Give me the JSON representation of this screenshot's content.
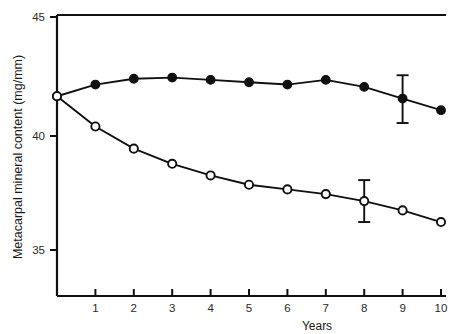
{
  "chart_data": {
    "type": "line",
    "title": "",
    "xlabel": "Years",
    "ylabel": "Metacarpal mineral content (mg/mm)",
    "x": [
      0,
      1,
      2,
      3,
      4,
      5,
      6,
      7,
      8,
      9,
      10
    ],
    "xlim": [
      0,
      10
    ],
    "ylim": [
      33.2,
      45
    ],
    "xticks": [
      0,
      1,
      2,
      3,
      4,
      5,
      6,
      7,
      8,
      9,
      10
    ],
    "xtick_labels": [
      "",
      "1",
      "2",
      "3",
      "4",
      "5",
      "6",
      "7",
      "8",
      "9",
      "10"
    ],
    "yticks": [
      35,
      40,
      45
    ],
    "ytick_labels": [
      "35",
      "40",
      "45"
    ],
    "grid": false,
    "legend": "none",
    "series": [
      {
        "name": "filled-circle-series",
        "marker": "filled-circle",
        "values": [
          41.6,
          42.1,
          42.35,
          42.4,
          42.3,
          42.2,
          42.1,
          42.3,
          42.0,
          41.5,
          41.0
        ],
        "errorbars": [
          {
            "x": 9,
            "y": 41.5,
            "low": 40.45,
            "high": 42.5
          }
        ]
      },
      {
        "name": "open-circle-series",
        "marker": "open-circle",
        "values": [
          41.6,
          40.3,
          39.35,
          38.7,
          38.2,
          37.8,
          37.6,
          37.4,
          37.1,
          36.7,
          36.2
        ],
        "errorbars": [
          {
            "x": 8,
            "y": 37.1,
            "low": 36.2,
            "high": 38.0
          }
        ]
      }
    ]
  },
  "axes": {
    "y_axis_label": "Metacarpal mineral content (mg/mm)",
    "x_axis_label": "Years",
    "y_top_label": "45",
    "y_mid_label": "40",
    "y_bottom_label": "35",
    "x_labels": [
      "1",
      "2",
      "3",
      "4",
      "5",
      "6",
      "7",
      "8",
      "9",
      "10"
    ]
  },
  "colors": {
    "line": "#101010",
    "marker_fill": "#101010",
    "marker_open_fill": "#ffffff",
    "axis": "#101010",
    "background": "#ffffff"
  }
}
